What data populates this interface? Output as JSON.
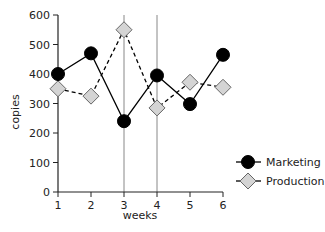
{
  "chart_data": {
    "type": "line",
    "title": "",
    "xlabel": "weeks",
    "ylabel": "copies",
    "x": [
      1,
      2,
      3,
      4,
      5,
      6
    ],
    "xticks": [
      "1",
      "2",
      "3",
      "4",
      "5",
      "6"
    ],
    "yticks": [
      "0",
      "100",
      "200",
      "300",
      "400",
      "500",
      "600"
    ],
    "ylim": [
      0,
      600
    ],
    "xlim": [
      1,
      6
    ],
    "grid": false,
    "vertical_reference_lines": [
      3,
      4
    ],
    "legend_position": "right",
    "series": [
      {
        "name": "Marketing",
        "values": [
          400,
          470,
          240,
          395,
          298,
          465
        ],
        "line": "solid",
        "marker": "circle",
        "color": "#000000"
      },
      {
        "name": "Production",
        "values": [
          350,
          325,
          550,
          285,
          372,
          355
        ],
        "line": "dashed",
        "marker": "diamond",
        "color": "#d0d0d0"
      }
    ]
  }
}
